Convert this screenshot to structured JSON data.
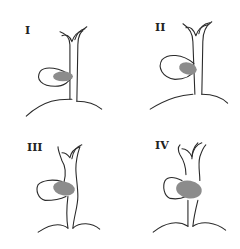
{
  "figure": {
    "type": "2x2 anatomical classification diagram",
    "colors": {
      "line": "#2a2a2a",
      "stone_fill": "#8c8c8c",
      "background": "#ffffff"
    },
    "panels": [
      {
        "label": "I",
        "description": "gallbladder with small stone at neck, duct intact"
      },
      {
        "label": "II",
        "description": "stone larger, eroding into duct"
      },
      {
        "label": "III",
        "description": "stone occupies larger part of duct circumference"
      },
      {
        "label": "IV",
        "description": "stone fully replaces duct wall"
      }
    ]
  }
}
